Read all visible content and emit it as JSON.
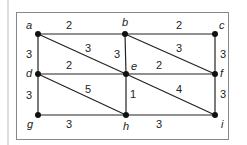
{
  "diagram": {
    "type": "weighted-graph",
    "nodes": [
      {
        "id": "a",
        "label": "a",
        "x": 38,
        "y": 34
      },
      {
        "id": "b",
        "label": "b",
        "x": 125,
        "y": 34
      },
      {
        "id": "c",
        "label": "c",
        "x": 215,
        "y": 34
      },
      {
        "id": "d",
        "label": "d",
        "x": 38,
        "y": 74
      },
      {
        "id": "e",
        "label": "e",
        "x": 126,
        "y": 74
      },
      {
        "id": "f",
        "label": "f",
        "x": 215,
        "y": 74
      },
      {
        "id": "g",
        "label": "g",
        "x": 38,
        "y": 115
      },
      {
        "id": "h",
        "label": "h",
        "x": 126,
        "y": 115
      },
      {
        "id": "i",
        "label": "i",
        "x": 215,
        "y": 115
      }
    ],
    "edges": [
      {
        "from": "a",
        "to": "b",
        "weight": "2"
      },
      {
        "from": "b",
        "to": "c",
        "weight": "2"
      },
      {
        "from": "a",
        "to": "d",
        "weight": "3"
      },
      {
        "from": "a",
        "to": "e",
        "weight": "3"
      },
      {
        "from": "b",
        "to": "e",
        "weight": "3"
      },
      {
        "from": "b",
        "to": "f",
        "weight": "3"
      },
      {
        "from": "c",
        "to": "f",
        "weight": "3"
      },
      {
        "from": "d",
        "to": "e",
        "weight": "2"
      },
      {
        "from": "e",
        "to": "f",
        "weight": "2"
      },
      {
        "from": "d",
        "to": "g",
        "weight": "3"
      },
      {
        "from": "d",
        "to": "h",
        "weight": "5"
      },
      {
        "from": "e",
        "to": "h",
        "weight": "1"
      },
      {
        "from": "e",
        "to": "i",
        "weight": "4"
      },
      {
        "from": "f",
        "to": "i",
        "weight": "3"
      },
      {
        "from": "g",
        "to": "h",
        "weight": "3"
      },
      {
        "from": "h",
        "to": "i",
        "weight": "3"
      }
    ]
  },
  "labels": {
    "a": "a",
    "b": "b",
    "c": "c",
    "d": "d",
    "e": "e",
    "f": "f",
    "g": "g",
    "h": "h",
    "i": "i",
    "w_ab": "2",
    "w_bc": "2",
    "w_ad": "3",
    "w_ae": "3",
    "w_be": "3",
    "w_bf": "3",
    "w_cf": "3",
    "w_de": "2",
    "w_ef": "2",
    "w_dg": "3",
    "w_dh": "5",
    "w_eh": "1",
    "w_ei": "4",
    "w_fi": "3",
    "w_gh": "3",
    "w_hi": "3"
  }
}
